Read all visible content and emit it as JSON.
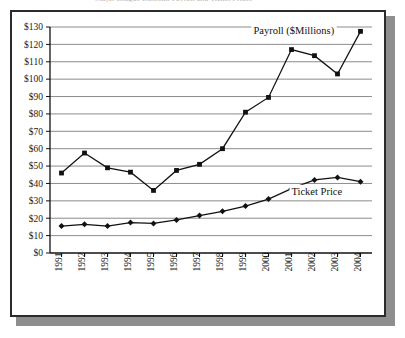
{
  "figure": {
    "frame_border_color": "#2b2b2b",
    "shadow_color": "#8e8e8e",
    "title_sliver": "Major League Baseball Payroll and Ticket Prices"
  },
  "chart_data": {
    "type": "line",
    "title": "",
    "xlabel": "",
    "ylabel": "",
    "categories": [
      "1991",
      "1992",
      "1993",
      "1994",
      "1995",
      "1996",
      "1997",
      "1998",
      "1999",
      "2000",
      "2001",
      "2002",
      "2003",
      "2004"
    ],
    "ylim": [
      0,
      130
    ],
    "ytick_step": 10,
    "ytick_labels": [
      "$0",
      "$10",
      "$20",
      "$30",
      "$40",
      "$50",
      "$60",
      "$70",
      "$80",
      "$90",
      "$100",
      "$110",
      "$120",
      "$130"
    ],
    "ytick_values": [
      0,
      10,
      20,
      30,
      40,
      50,
      60,
      70,
      80,
      90,
      100,
      110,
      120,
      130
    ],
    "grid": true,
    "grid_axis": "y",
    "legend": "annotations-inline",
    "series": [
      {
        "name": "Payroll ($Millions)",
        "marker": "square",
        "color": "#111111",
        "annotation": "Payroll ($Millions)",
        "annotation_x": 2001.1,
        "annotation_y": 126,
        "values": [
          46,
          57.5,
          49,
          46.5,
          36,
          47.5,
          51,
          60,
          81,
          89.5,
          117,
          113.5,
          103,
          127.5
        ]
      },
      {
        "name": "Ticket Price",
        "marker": "diamond",
        "color": "#111111",
        "annotation": "Ticket Price",
        "annotation_x": 2002.1,
        "annotation_y": 33.5,
        "values": [
          15.5,
          16.5,
          15.5,
          17.5,
          17,
          19,
          21.5,
          24,
          27,
          31,
          37,
          42,
          43.5,
          41
        ]
      }
    ]
  }
}
